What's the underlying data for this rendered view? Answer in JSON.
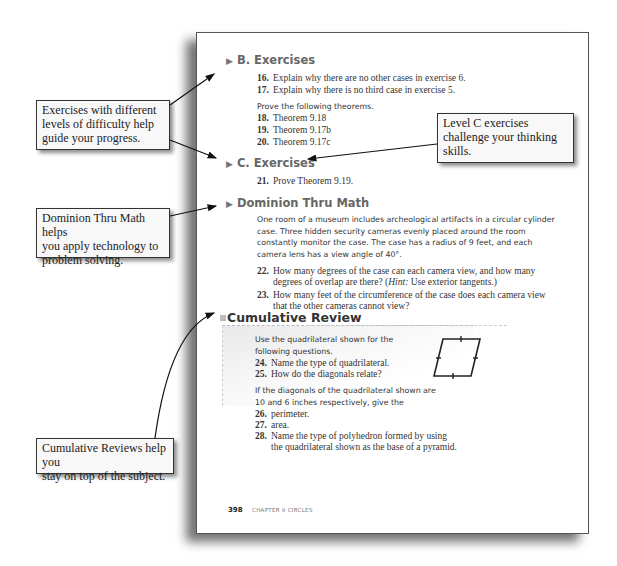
{
  "page": {
    "sections": {
      "b_exercises": {
        "heading": "B. Exercises",
        "items": [
          {
            "num": "16.",
            "text": "Explain why there are no other cases in exercise 6."
          },
          {
            "num": "17.",
            "text": "Explain why there is no third case in exercise 5."
          }
        ],
        "instruction": "Prove the following theorems.",
        "theorems": [
          {
            "num": "18.",
            "text": "Theorem 9.18"
          },
          {
            "num": "19.",
            "text": "Theorem 9.17b"
          },
          {
            "num": "20.",
            "text": "Theorem 9.17c"
          }
        ]
      },
      "c_exercises": {
        "heading": "C. Exercises",
        "items": [
          {
            "num": "21.",
            "text": "Prove Theorem 9.19."
          }
        ]
      },
      "dominion": {
        "heading": "Dominion Thru Math",
        "paragraph_lines": [
          "One room of a museum includes archeological artifacts in a circular cylinder",
          "case. Three hidden security cameras evenly placed around the room",
          "constantly monitor the case. The case has a radius of 9 feet, and each",
          "camera lens has a view angle of 40°."
        ],
        "items": [
          {
            "num": "22.",
            "line1": "How many degrees of the case can each camera view, and how many",
            "line2a": "degrees of overlap are there? (",
            "hint": "Hint:",
            "line2b": " Use exterior tangents.)"
          },
          {
            "num": "23.",
            "line1": "How many feet of the circumference of the case does each camera view",
            "line2": "that the other cameras cannot view?"
          }
        ]
      },
      "cumulative": {
        "heading": "Cumulative Review",
        "intro_lines": [
          "Use the quadrilateral shown for the",
          "following questions."
        ],
        "items_a": [
          {
            "num": "24.",
            "text": "Name the type of quadrilateral."
          },
          {
            "num": "25.",
            "text": "How do the diagonals relate?"
          }
        ],
        "intro2_lines": [
          "If the diagonals of the quadrilateral shown are",
          "10 and 6 inches respectively, give the"
        ],
        "items_b": [
          {
            "num": "26.",
            "text": "perimeter."
          },
          {
            "num": "27.",
            "text": "area."
          },
          {
            "num": "28.",
            "line1": "Name the type of polyhedron formed by using",
            "line2": "the quadrilateral shown as the base of a pyramid."
          }
        ]
      }
    },
    "footer": {
      "page_number": "398",
      "chapter": "CHAPTER 9   CIRCLES"
    }
  },
  "callouts": {
    "exercises": [
      "Exercises with different",
      "levels of difficulty help",
      "guide your progress."
    ],
    "level_c": [
      "Level C exercises",
      "challenge your thinking",
      "skills."
    ],
    "dominion": [
      "Dominion Thru Math helps",
      "you apply technology to",
      "problem solving."
    ],
    "cumulative": [
      "Cumulative Reviews help you",
      "stay on top of the subject."
    ]
  }
}
